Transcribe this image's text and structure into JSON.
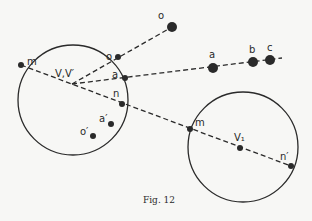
{
  "figure": {
    "caption": "Fig. 12",
    "colors": {
      "ink": "#2a2a2a",
      "background": "#f7f7f5"
    }
  },
  "circles": [
    {
      "id": "left-circle",
      "cx": 73,
      "cy": 100,
      "r": 55,
      "center_label": "V,V′"
    },
    {
      "id": "right-circle",
      "cx": 243,
      "cy": 147,
      "r": 55,
      "center_label": "V₁"
    }
  ],
  "labels": {
    "vertex": "V,V′",
    "left_m": "m",
    "left_o": "o",
    "left_a": "a",
    "left_n": "n",
    "left_a_prime": "a′",
    "left_o_prime": "o′",
    "outer_o": "o",
    "outer_a": "a",
    "outer_b": "b",
    "outer_c": "c",
    "right_m": "m",
    "right_v1": "V₁",
    "right_n_prime": "n′"
  },
  "points": [
    {
      "name": "left-m",
      "x": 21,
      "y": 65
    },
    {
      "name": "left-o",
      "x": 118,
      "y": 57
    },
    {
      "name": "left-a",
      "x": 125,
      "y": 78
    },
    {
      "name": "left-n",
      "x": 122,
      "y": 104
    },
    {
      "name": "left-a-prime",
      "x": 111,
      "y": 124
    },
    {
      "name": "left-o-prime",
      "x": 93,
      "y": 136
    },
    {
      "name": "outer-o",
      "x": 172,
      "y": 27
    },
    {
      "name": "outer-a",
      "x": 213,
      "y": 68
    },
    {
      "name": "outer-b",
      "x": 253,
      "y": 62
    },
    {
      "name": "outer-c",
      "x": 270,
      "y": 60
    },
    {
      "name": "right-m",
      "x": 190,
      "y": 129
    },
    {
      "name": "right-v1",
      "x": 240,
      "y": 148
    },
    {
      "name": "right-n-prime",
      "x": 291,
      "y": 166
    }
  ]
}
